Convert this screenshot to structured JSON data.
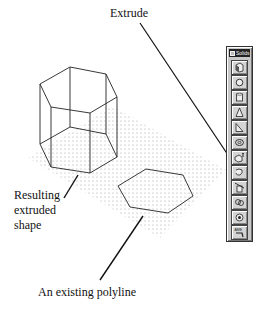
{
  "labels": {
    "extrude": "Extrude",
    "resulting_line1": "Resulting",
    "resulting_line2": "extruded",
    "resulting_line3": "shape",
    "polyline": "An existing polyline"
  },
  "toolbar": {
    "title": "Solids",
    "buttons": [
      {
        "name": "box",
        "icon": "box-icon"
      },
      {
        "name": "sphere",
        "icon": "sphere-icon"
      },
      {
        "name": "cylinder",
        "icon": "cylinder-icon"
      },
      {
        "name": "cone",
        "icon": "cone-icon"
      },
      {
        "name": "wedge",
        "icon": "wedge-icon"
      },
      {
        "name": "torus",
        "icon": "torus-icon"
      },
      {
        "name": "extrude",
        "icon": "extrude-icon"
      },
      {
        "name": "revolve",
        "icon": "revolve-icon"
      },
      {
        "name": "slice",
        "icon": "slice-icon"
      },
      {
        "name": "section",
        "icon": "section-icon"
      },
      {
        "name": "interference",
        "icon": "interference-icon"
      },
      {
        "name": "ame-convert",
        "icon": "ame-convert-icon",
        "text": "AME"
      }
    ]
  },
  "colors": {
    "line": "#222222",
    "grid_dot": "#9a9a9a",
    "toolbar_bg": "#c8c8c8",
    "titlebar": "#222222"
  }
}
